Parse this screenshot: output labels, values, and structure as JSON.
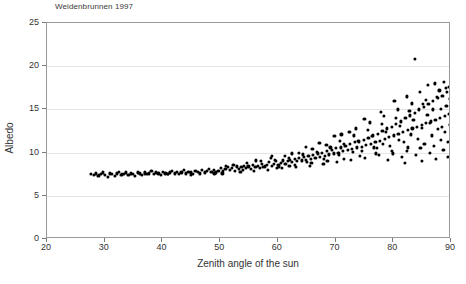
{
  "chart_data": {
    "type": "scatter",
    "title": "Weidenbrunnen 1997",
    "xlabel": "Zenith angle of the sun",
    "ylabel": "Albedo",
    "xlim": [
      20,
      90
    ],
    "ylim": [
      0,
      25
    ],
    "xticks": [
      20,
      30,
      40,
      50,
      60,
      70,
      80,
      90
    ],
    "yticks": [
      0,
      5,
      10,
      15,
      20,
      25
    ],
    "grid": "horizontal",
    "legend": null,
    "marker": "filled-circle",
    "marker_color": "#000000",
    "series": [
      {
        "name": "Albedo vs zenith angle",
        "points": [
          [
            27.6,
            7.5
          ],
          [
            28.1,
            7.4
          ],
          [
            28.5,
            7.6
          ],
          [
            28.9,
            7.3
          ],
          [
            29.3,
            7.5
          ],
          [
            29.7,
            7.7
          ],
          [
            30.1,
            7.4
          ],
          [
            30.5,
            7.2
          ],
          [
            30.9,
            7.6
          ],
          [
            31.3,
            7.5
          ],
          [
            31.7,
            7.3
          ],
          [
            32.1,
            7.6
          ],
          [
            32.5,
            7.8
          ],
          [
            32.9,
            7.4
          ],
          [
            33.3,
            7.5
          ],
          [
            33.7,
            7.7
          ],
          [
            34.1,
            7.4
          ],
          [
            34.5,
            7.6
          ],
          [
            34.9,
            7.5
          ],
          [
            35.3,
            7.3
          ],
          [
            35.7,
            7.7
          ],
          [
            36.1,
            7.6
          ],
          [
            36.5,
            7.4
          ],
          [
            36.9,
            7.8
          ],
          [
            37.3,
            7.5
          ],
          [
            37.7,
            7.6
          ],
          [
            38.1,
            7.9
          ],
          [
            38.5,
            7.5
          ],
          [
            38.9,
            7.7
          ],
          [
            39.3,
            7.6
          ],
          [
            39.7,
            7.4
          ],
          [
            40.1,
            7.8
          ],
          [
            40.5,
            7.6
          ],
          [
            40.9,
            7.5
          ],
          [
            41.3,
            7.7
          ],
          [
            41.7,
            7.9
          ],
          [
            42.1,
            7.6
          ],
          [
            42.5,
            7.8
          ],
          [
            42.9,
            7.5
          ],
          [
            43.3,
            7.7
          ],
          [
            43.7,
            8.0
          ],
          [
            44.1,
            7.6
          ],
          [
            44.5,
            7.8
          ],
          [
            44.9,
            7.7
          ],
          [
            45.3,
            7.5
          ],
          [
            45.7,
            7.9
          ],
          [
            46.1,
            7.8
          ],
          [
            46.5,
            7.6
          ],
          [
            46.9,
            8.0
          ],
          [
            47.3,
            7.7
          ],
          [
            47.7,
            7.9
          ],
          [
            48.1,
            8.1
          ],
          [
            48.5,
            7.8
          ],
          [
            48.9,
            8.0
          ],
          [
            49.3,
            7.7
          ],
          [
            49.7,
            7.9
          ],
          [
            50.1,
            8.2
          ],
          [
            50.5,
            7.9
          ],
          [
            50.9,
            8.1
          ],
          [
            51.3,
            8.3
          ],
          [
            51.7,
            8.0
          ],
          [
            52.1,
            8.2
          ],
          [
            52.5,
            7.9
          ],
          [
            52.9,
            8.4
          ],
          [
            53.3,
            8.1
          ],
          [
            53.7,
            8.3
          ],
          [
            54.1,
            8.5
          ],
          [
            54.5,
            8.2
          ],
          [
            54.9,
            8.4
          ],
          [
            55.3,
            8.1
          ],
          [
            55.7,
            8.6
          ],
          [
            56.1,
            8.3
          ],
          [
            56.5,
            8.5
          ],
          [
            56.9,
            8.2
          ],
          [
            57.3,
            8.7
          ],
          [
            57.7,
            8.4
          ],
          [
            58.1,
            8.6
          ],
          [
            58.5,
            8.9
          ],
          [
            58.9,
            8.5
          ],
          [
            59.3,
            8.7
          ],
          [
            59.7,
            9.0
          ],
          [
            60.1,
            8.6
          ],
          [
            60.5,
            8.8
          ],
          [
            60.9,
            9.1
          ],
          [
            61.3,
            8.7
          ],
          [
            61.7,
            9.0
          ],
          [
            62.1,
            9.2
          ],
          [
            62.5,
            8.9
          ],
          [
            62.9,
            9.3
          ],
          [
            63.3,
            9.0
          ],
          [
            63.7,
            9.4
          ],
          [
            64.1,
            9.1
          ],
          [
            64.5,
            9.5
          ],
          [
            64.9,
            9.2
          ],
          [
            65.3,
            9.6
          ],
          [
            65.7,
            9.3
          ],
          [
            66.1,
            9.7
          ],
          [
            66.5,
            9.4
          ],
          [
            66.9,
            9.9
          ],
          [
            67.3,
            9.5
          ],
          [
            67.7,
            10.0
          ],
          [
            68.1,
            9.6
          ],
          [
            68.5,
            10.2
          ],
          [
            68.9,
            9.8
          ],
          [
            69.3,
            10.3
          ],
          [
            69.7,
            9.9
          ],
          [
            70.1,
            10.5
          ],
          [
            70.5,
            10.0
          ],
          [
            70.9,
            10.6
          ],
          [
            71.3,
            10.2
          ],
          [
            71.7,
            10.8
          ],
          [
            72.1,
            10.3
          ],
          [
            72.5,
            11.0
          ],
          [
            72.9,
            10.4
          ],
          [
            73.3,
            11.2
          ],
          [
            73.7,
            10.6
          ],
          [
            74.1,
            11.3
          ],
          [
            74.5,
            10.7
          ],
          [
            74.9,
            11.5
          ],
          [
            75.3,
            10.9
          ],
          [
            75.7,
            11.7
          ],
          [
            76.1,
            11.0
          ],
          [
            76.5,
            12.0
          ],
          [
            76.9,
            11.2
          ],
          [
            77.3,
            12.2
          ],
          [
            77.7,
            11.4
          ],
          [
            78.1,
            12.5
          ],
          [
            78.5,
            11.6
          ],
          [
            78.9,
            12.8
          ],
          [
            79.3,
            11.8
          ],
          [
            79.7,
            13.0
          ],
          [
            80.1,
            12.0
          ],
          [
            80.5,
            13.3
          ],
          [
            80.9,
            12.2
          ],
          [
            81.3,
            13.6
          ],
          [
            81.7,
            12.4
          ],
          [
            82.1,
            14.0
          ],
          [
            82.5,
            12.6
          ],
          [
            82.9,
            14.3
          ],
          [
            83.3,
            12.8
          ],
          [
            83.7,
            14.6
          ],
          [
            84.1,
            13.0
          ],
          [
            84.5,
            15.0
          ],
          [
            84.9,
            13.2
          ],
          [
            85.3,
            15.3
          ],
          [
            85.7,
            13.4
          ],
          [
            86.1,
            15.6
          ],
          [
            86.5,
            13.6
          ],
          [
            86.9,
            16.0
          ],
          [
            87.3,
            13.8
          ],
          [
            87.7,
            16.3
          ],
          [
            88.1,
            14.0
          ],
          [
            88.5,
            16.6
          ],
          [
            88.9,
            14.2
          ],
          [
            89.3,
            17.0
          ],
          [
            89.7,
            14.5
          ],
          [
            89.9,
            16.2
          ],
          [
            50.4,
            7.6
          ],
          [
            51.0,
            8.5
          ],
          [
            52.3,
            8.6
          ],
          [
            53.5,
            7.8
          ],
          [
            54.7,
            8.8
          ],
          [
            55.9,
            7.9
          ],
          [
            57.1,
            9.0
          ],
          [
            58.3,
            8.0
          ],
          [
            59.5,
            9.2
          ],
          [
            60.7,
            8.2
          ],
          [
            61.9,
            9.4
          ],
          [
            63.1,
            8.3
          ],
          [
            64.3,
            9.8
          ],
          [
            65.5,
            8.5
          ],
          [
            66.7,
            10.1
          ],
          [
            67.9,
            8.7
          ],
          [
            69.1,
            10.6
          ],
          [
            70.3,
            8.9
          ],
          [
            71.5,
            11.0
          ],
          [
            72.7,
            9.2
          ],
          [
            73.9,
            11.4
          ],
          [
            75.1,
            9.4
          ],
          [
            76.3,
            11.9
          ],
          [
            77.5,
            9.7
          ],
          [
            78.7,
            12.4
          ],
          [
            79.9,
            9.9
          ],
          [
            81.1,
            13.1
          ],
          [
            82.3,
            10.2
          ],
          [
            83.5,
            13.8
          ],
          [
            84.7,
            10.5
          ],
          [
            85.9,
            14.4
          ],
          [
            87.1,
            10.8
          ],
          [
            88.3,
            15.1
          ],
          [
            89.5,
            11.2
          ],
          [
            56.2,
            9.1
          ],
          [
            58.8,
            9.4
          ],
          [
            61.2,
            9.6
          ],
          [
            63.6,
            10.0
          ],
          [
            66.0,
            10.4
          ],
          [
            68.4,
            10.9
          ],
          [
            70.8,
            11.4
          ],
          [
            73.2,
            12.0
          ],
          [
            75.6,
            12.6
          ],
          [
            78.0,
            13.3
          ],
          [
            80.4,
            14.0
          ],
          [
            82.8,
            14.8
          ],
          [
            85.2,
            15.6
          ],
          [
            87.6,
            16.4
          ],
          [
            57.4,
            8.3
          ],
          [
            60.2,
            8.4
          ],
          [
            63.0,
            8.6
          ],
          [
            65.8,
            8.8
          ],
          [
            68.6,
            9.0
          ],
          [
            71.4,
            9.3
          ],
          [
            74.2,
            9.6
          ],
          [
            77.0,
            9.9
          ],
          [
            79.8,
            10.2
          ],
          [
            82.6,
            10.6
          ],
          [
            85.4,
            11.0
          ],
          [
            88.2,
            11.5
          ],
          [
            71.0,
            12.1
          ],
          [
            73.5,
            12.8
          ],
          [
            76.0,
            13.5
          ],
          [
            78.4,
            14.2
          ],
          [
            80.8,
            15.0
          ],
          [
            83.2,
            15.7
          ],
          [
            85.6,
            16.1
          ],
          [
            88.0,
            17.2
          ],
          [
            89.1,
            17.5
          ],
          [
            74.6,
            10.2
          ],
          [
            77.2,
            10.5
          ],
          [
            79.4,
            10.8
          ],
          [
            81.8,
            11.2
          ],
          [
            84.3,
            11.6
          ],
          [
            86.7,
            12.0
          ],
          [
            89.0,
            12.4
          ],
          [
            79.0,
            9.2
          ],
          [
            81.5,
            9.5
          ],
          [
            83.9,
            9.7
          ],
          [
            86.3,
            10.0
          ],
          [
            88.7,
            10.3
          ],
          [
            82.0,
            8.8
          ],
          [
            84.9,
            9.0
          ],
          [
            87.4,
            9.3
          ],
          [
            89.4,
            9.5
          ],
          [
            83.8,
            20.8
          ],
          [
            86.0,
            17.8
          ],
          [
            87.2,
            18.0
          ],
          [
            89.6,
            17.6
          ],
          [
            88.8,
            18.2
          ],
          [
            80.2,
            16.0
          ],
          [
            82.4,
            16.5
          ],
          [
            84.6,
            17.0
          ],
          [
            86.8,
            15.0
          ],
          [
            75.0,
            13.9
          ],
          [
            77.8,
            14.7
          ],
          [
            69.8,
            11.9
          ],
          [
            72.4,
            12.4
          ],
          [
            64.8,
            10.7
          ],
          [
            67.2,
            11.1
          ],
          [
            62.4,
            9.9
          ],
          [
            59.0,
            9.6
          ],
          [
            89.8,
            13.2
          ],
          [
            89.2,
            15.4
          ],
          [
            88.4,
            13.0
          ],
          [
            87.8,
            12.7
          ],
          [
            86.4,
            13.4
          ],
          [
            85.0,
            12.9
          ],
          [
            83.0,
            12.1
          ],
          [
            81.0,
            11.5
          ],
          [
            78.2,
            11.0
          ],
          [
            76.6,
            10.6
          ],
          [
            73.0,
            10.1
          ],
          [
            70.6,
            9.7
          ],
          [
            68.0,
            9.3
          ],
          [
            65.0,
            8.9
          ],
          [
            62.0,
            8.5
          ],
          [
            59.8,
            8.2
          ],
          [
            54.0,
            8.0
          ],
          [
            49.0,
            7.6
          ],
          [
            45.0,
            7.4
          ],
          [
            41.0,
            7.5
          ],
          [
            37.0,
            7.6
          ],
          [
            33.0,
            7.5
          ],
          [
            29.0,
            7.4
          ]
        ]
      }
    ]
  }
}
